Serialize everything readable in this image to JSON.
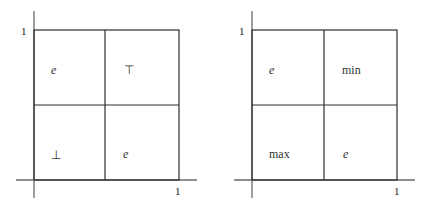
{
  "diagrams": [
    {
      "name": "left-square",
      "origin": {
        "x": 34,
        "y": 180
      },
      "size": 145,
      "axis_label_y": "1",
      "axis_label_x": "1",
      "cells": {
        "top_left": "e",
        "top_right": "⊤",
        "bottom_left": "⊥",
        "bottom_right": "e"
      }
    },
    {
      "name": "right-square",
      "origin": {
        "x": 252,
        "y": 180
      },
      "size": 145,
      "axis_label_y": "1",
      "axis_label_x": "1",
      "cells": {
        "top_left": "e",
        "top_right": "min",
        "bottom_left": "max",
        "bottom_right": "e"
      }
    }
  ]
}
